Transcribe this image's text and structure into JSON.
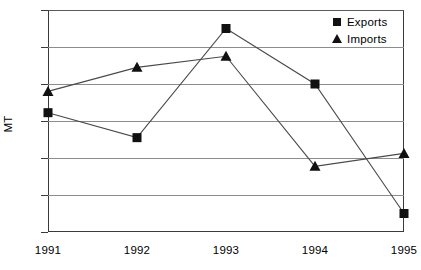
{
  "chart_data": {
    "type": "line",
    "title": "",
    "xlabel": "",
    "ylabel": "MT",
    "categories": [
      "1991",
      "1992",
      "1993",
      "1994",
      "1995"
    ],
    "series": [
      {
        "name": "Exports",
        "marker": "square",
        "values": [
          645,
          510,
          1100,
          800,
          100
        ]
      },
      {
        "name": "Imports",
        "marker": "triangle",
        "values": [
          760,
          890,
          950,
          355,
          425
        ]
      }
    ],
    "ylim": [
      0,
      1200
    ],
    "yticks": [
      0,
      200,
      400,
      600,
      800,
      1000,
      1200
    ],
    "ytick_labels": [
      "0",
      "200",
      "400",
      "600",
      "800",
      "1000",
      "1200"
    ],
    "grid": true,
    "grid_axis": "y",
    "legend_position": "top-right",
    "colors": {
      "line": "#4a4a4a",
      "marker": "#111111",
      "grid": "#8c8c8c",
      "axis": "#3a3a3a"
    }
  },
  "legend": {
    "entries": [
      {
        "label": "Exports",
        "marker": "square-marker-icon"
      },
      {
        "label": "Imports",
        "marker": "triangle-marker-icon"
      }
    ]
  }
}
